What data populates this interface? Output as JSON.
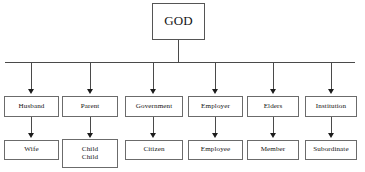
{
  "diagram": {
    "type": "org-chart",
    "title_text": "",
    "root": {
      "label": "GOD"
    },
    "columns": [
      {
        "level1": "Husband",
        "level2": "Wife"
      },
      {
        "level1": "Parent",
        "level2": "Child\nChild"
      },
      {
        "level1": "Government",
        "level2": "Citizen"
      },
      {
        "level1": "Employer",
        "level2": "Employee"
      },
      {
        "level1": "Elders",
        "level2": "Member"
      },
      {
        "level1": "Institution",
        "level2": "Subordinate"
      }
    ],
    "colors": {
      "background": "#ffffff",
      "box_border": "#6b6b6b",
      "connector": "#4a4a4a",
      "arrowhead": "#1c1c1c",
      "text": "#141414"
    }
  }
}
